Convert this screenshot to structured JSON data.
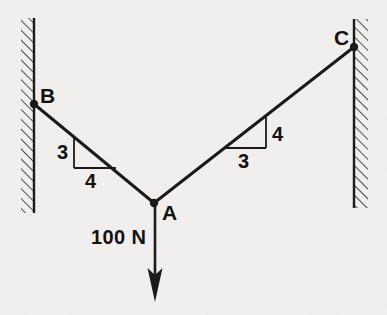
{
  "figure": {
    "type": "statics-free-body-diagram",
    "background_color": "#f2f1ef",
    "line_color": "#151515",
    "points": {
      "A": {
        "label": "A",
        "x": 154,
        "y": 203
      },
      "B": {
        "label": "B",
        "x": 34,
        "y": 104
      },
      "C": {
        "label": "C",
        "x": 354,
        "y": 47
      }
    },
    "members": [
      {
        "name": "cable-BA",
        "from": "B",
        "to": "A"
      },
      {
        "name": "cable-AC",
        "from": "A",
        "to": "C"
      }
    ],
    "walls": [
      {
        "name": "left-wall",
        "x": 34,
        "y_top": 18,
        "y_bottom": 213,
        "hatch_side": "left"
      },
      {
        "name": "right-wall",
        "x": 354,
        "y_top": 19,
        "y_bottom": 208,
        "hatch_side": "right"
      }
    ],
    "slope_triangles": [
      {
        "name": "slope-triangle-left",
        "member": "cable-BA",
        "vertical_label": "3",
        "horizontal_label": "4",
        "rise": 3,
        "run": 4
      },
      {
        "name": "slope-triangle-right",
        "member": "cable-AC",
        "vertical_label": "4",
        "horizontal_label": "3",
        "rise": 4,
        "run": 3
      }
    ],
    "load": {
      "name": "applied-load",
      "label": "100 N",
      "magnitude": 100,
      "unit": "N",
      "direction": "down",
      "applied_at": "A"
    }
  }
}
